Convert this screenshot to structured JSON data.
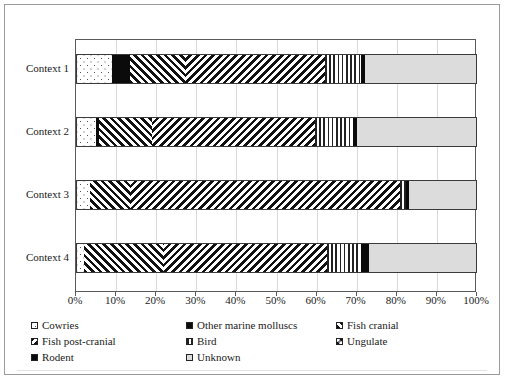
{
  "chart_data": {
    "type": "bar",
    "orientation": "horizontal",
    "stacked": true,
    "normalized_percent": true,
    "title": "",
    "xlabel": "",
    "ylabel": "",
    "xlim": [
      0,
      100
    ],
    "xticks": [
      "0%",
      "10%",
      "20%",
      "30%",
      "40%",
      "50%",
      "60%",
      "70%",
      "80%",
      "90%",
      "100%"
    ],
    "grid": true,
    "grid_axis": "x",
    "legend_position": "bottom",
    "categories": [
      "Context 1",
      "Context 2",
      "Context 3",
      "Context 4"
    ],
    "series": [
      {
        "name": "Cowries",
        "pattern": "sparse-dots",
        "values": [
          9.0,
          5.0,
          3.5,
          2.0
        ]
      },
      {
        "name": "Other marine molluscs",
        "pattern": "solid-black-dotted",
        "values": [
          4.5,
          0.8,
          0.0,
          0.0
        ]
      },
      {
        "name": "Fish cranial",
        "pattern": "diagonal-forward",
        "values": [
          14.0,
          13.2,
          10.0,
          20.0
        ]
      },
      {
        "name": "Fish post-cranial",
        "pattern": "diagonal-back",
        "values": [
          34.5,
          40.5,
          67.3,
          40.6
        ]
      },
      {
        "name": "Bird",
        "pattern": "vertical-stripes",
        "values": [
          9.2,
          9.5,
          1.5,
          8.5
        ]
      },
      {
        "name": "Ungulate",
        "pattern": "checker",
        "values": [
          0.0,
          0.0,
          0.0,
          0.0
        ]
      },
      {
        "name": "Rodent",
        "pattern": "solid-black",
        "values": [
          1.0,
          1.0,
          0.7,
          2.0
        ]
      },
      {
        "name": "Unknown",
        "pattern": "light-grey",
        "values": [
          27.8,
          30.0,
          17.0,
          26.9
        ]
      }
    ]
  },
  "axis": {
    "y_labels": [
      "Context 1",
      "Context 2",
      "Context 3",
      "Context 4"
    ],
    "x_labels": [
      "0%",
      "10%",
      "20%",
      "30%",
      "40%",
      "50%",
      "60%",
      "70%",
      "80%",
      "90%",
      "100%"
    ]
  },
  "legend": {
    "items": [
      {
        "label": "Cowries",
        "swatch": "sparse-dots"
      },
      {
        "label": "Other marine molluscs",
        "swatch": "solid-black-dotted"
      },
      {
        "label": "Fish cranial",
        "swatch": "diagonal-forward"
      },
      {
        "label": "Fish post-cranial",
        "swatch": "diagonal-back"
      },
      {
        "label": "Bird",
        "swatch": "vertical-stripes"
      },
      {
        "label": "Ungulate",
        "swatch": "checker"
      },
      {
        "label": "Rodent",
        "swatch": "solid-black"
      },
      {
        "label": "Unknown",
        "swatch": "light-grey"
      }
    ]
  },
  "colors": {
    "frame": "#9a9a9a",
    "plot_border": "#5a5a5a",
    "gridline": "#d9d9d9",
    "series_black": "#0a0a0a",
    "series_grey": "#dcdcdc",
    "text": "#1a1a1a"
  }
}
